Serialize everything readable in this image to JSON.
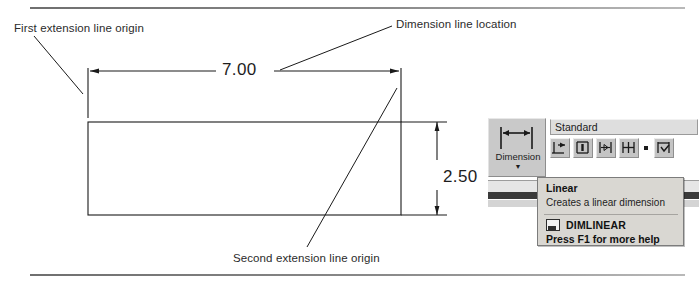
{
  "figure": {
    "callouts": [
      {
        "name": "first-extension-line-origin",
        "text": "First extension line origin"
      },
      {
        "name": "dimension-line-location",
        "text": "Dimension line location"
      },
      {
        "name": "second-extension-line-origin",
        "text": "Second extension line origin"
      }
    ],
    "dimensions": {
      "horizontal_value": "7.00",
      "vertical_value": "2.50"
    },
    "line_color": "#1a1a1a",
    "rule_color": "#7d7d7d"
  },
  "acad_panel": {
    "dimension_button": {
      "label": "Dimension",
      "dropdown_arrow": "▼",
      "icon": "linear-dimension-icon"
    },
    "dimstyle_combo": {
      "value": "Standard",
      "icon": "chevron-down-icon"
    },
    "tools": [
      {
        "name": "dimlinear-tool",
        "icon": "linear-dimension-icon"
      },
      {
        "name": "dimaligned-tool",
        "icon": "aligned-dimension-icon"
      },
      {
        "name": "dimangular-tool",
        "icon": "angular-dimension-icon"
      },
      {
        "name": "dimbaseline-tool",
        "icon": "baseline-dimension-icon"
      },
      {
        "name": "dimbreak-tool",
        "icon": "dimension-break-icon"
      }
    ],
    "accent_color": "#3a3a3a",
    "face_color": "#c9c9c9"
  },
  "tooltip": {
    "title": "Linear",
    "description": "Creates a linear dimension",
    "command": "DIMLINEAR",
    "command_icon": "command-icon",
    "help": "Press F1 for more help",
    "background": "#d9d7d2",
    "border": "#7c7c7c"
  }
}
